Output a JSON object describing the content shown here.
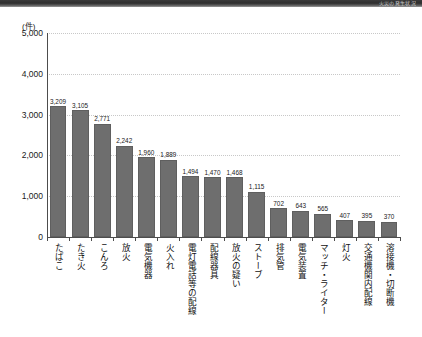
{
  "top_band": {
    "text": "火災の発生状況"
  },
  "chart_data": {
    "type": "bar",
    "title": "",
    "subtitle": "",
    "xlabel": "",
    "ylabel": "",
    "unit_label": "(件)",
    "ylim": [
      0,
      5000
    ],
    "ytick_values": [
      0,
      1000,
      2000,
      3000,
      4000,
      5000
    ],
    "ytick_labels": [
      "0",
      "1,000",
      "2,000",
      "3,000",
      "4,000",
      "5,000"
    ],
    "grid": "horizontal-dotted",
    "legend": "none",
    "bar_color": "#6e6e6e",
    "categories": [
      "たばこ",
      "たき火",
      "こんろ",
      "放火",
      "電気機器",
      "火入れ",
      "電灯電話等の配線",
      "配線器具",
      "放火の疑い",
      "ストーブ",
      "排気管",
      "電気装置",
      "マッチ・ライター",
      "灯火",
      "交通機関内配線",
      "溶接機・切断機"
    ],
    "values": [
      3209,
      3105,
      2771,
      2242,
      1960,
      1889,
      1494,
      1470,
      1468,
      1115,
      702,
      643,
      565,
      407,
      395,
      370
    ],
    "value_labels": [
      "3,209",
      "3,105",
      "2,771",
      "2,242",
      "1,960",
      "1,889",
      "1,494",
      "1,470",
      "1,468",
      "1,115",
      "702",
      "643",
      "565",
      "407",
      "395",
      "370"
    ]
  }
}
